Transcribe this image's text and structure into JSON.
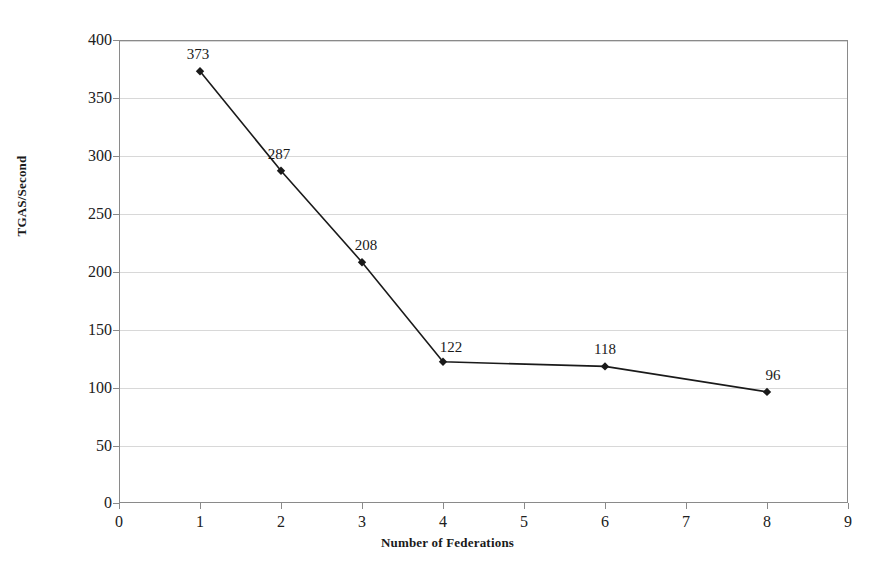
{
  "chart_data": {
    "type": "line",
    "title": "",
    "xlabel": "Number of Federations",
    "ylabel": "TGAS/Second",
    "x": [
      1,
      2,
      3,
      4,
      6,
      8
    ],
    "values": [
      373,
      287,
      208,
      122,
      118,
      96
    ],
    "point_labels": [
      "373",
      "287",
      "208",
      "122",
      "118",
      "96"
    ],
    "xlim": [
      0,
      9
    ],
    "ylim": [
      0,
      400
    ],
    "x_ticks": [
      0,
      1,
      2,
      3,
      4,
      5,
      6,
      7,
      8,
      9
    ],
    "x_tick_labels": [
      "0",
      "1",
      "2",
      "3",
      "4",
      "5",
      "6",
      "7",
      "8",
      "9"
    ],
    "y_ticks": [
      0,
      50,
      100,
      150,
      200,
      250,
      300,
      350,
      400
    ],
    "y_tick_labels": [
      "0",
      "50",
      "100",
      "150",
      "200",
      "250",
      "300",
      "350",
      "400"
    ],
    "grid": "horizontal",
    "legend": "none",
    "series": [
      {
        "name": "TGAS/Second",
        "marker": "diamond",
        "line_color": "#1a1a1a",
        "marker_color": "#1a1a1a",
        "values": [
          373,
          287,
          208,
          122,
          118,
          96
        ]
      }
    ],
    "colors": {
      "background": "#ffffff",
      "plot_background": "#ffffff",
      "gridline": "#d8d8d8",
      "axis": "#8a8a8a",
      "text": "#1a1a1a",
      "series": "#1a1a1a"
    }
  }
}
